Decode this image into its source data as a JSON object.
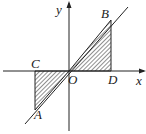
{
  "diagram": {
    "axes": {
      "x_label": "x",
      "y_label": "y",
      "origin_label": "O"
    },
    "points": {
      "A": "A",
      "B": "B",
      "C": "C",
      "D": "D"
    },
    "line": "y = kx through origin",
    "shaded_regions": [
      "triangle OBD",
      "triangle OCA"
    ],
    "colors": {
      "ink": "#222222",
      "background": "#ffffff"
    }
  }
}
